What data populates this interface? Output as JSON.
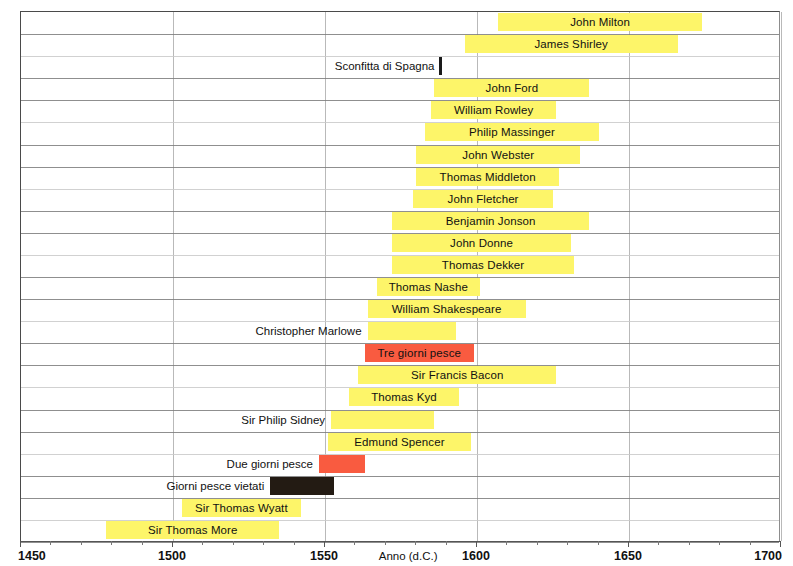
{
  "chart_data": {
    "type": "bar",
    "orientation": "horizontal",
    "title": "",
    "xlabel": "Anno (d.C.)",
    "ylabel": "",
    "xlim": [
      1450,
      1700
    ],
    "xticks": [
      1450,
      1500,
      1550,
      1600,
      1650,
      1700
    ],
    "xticklabels": [
      "1450",
      "1500",
      "1550",
      "1600",
      "1650",
      "1700"
    ],
    "grid": true,
    "legend": "none",
    "colors": {
      "author": "#fdf569",
      "fish_days": "#f95b40",
      "forbidden": "#231b13",
      "event_marker": "#1a1a1a",
      "gridline": "#b9b9b9",
      "axis": "#555555"
    },
    "series": [
      {
        "label": "John Milton",
        "start": 1607,
        "end": 1674,
        "kind": "author",
        "color": "#fdf569"
      },
      {
        "label": "James Shirley",
        "start": 1596,
        "end": 1666,
        "kind": "author",
        "color": "#fdf569"
      },
      {
        "label": "Sconfitta di Spagna",
        "start": 1588,
        "end": 1588,
        "kind": "event",
        "color": "#1a1a1a"
      },
      {
        "label": "John Ford",
        "start": 1586,
        "end": 1637,
        "kind": "author",
        "color": "#fdf569"
      },
      {
        "label": "William Rowley",
        "start": 1585,
        "end": 1626,
        "kind": "author",
        "color": "#fdf569"
      },
      {
        "label": "Philip Massinger",
        "start": 1583,
        "end": 1640,
        "kind": "author",
        "color": "#fdf569"
      },
      {
        "label": "John Webster",
        "start": 1580,
        "end": 1634,
        "kind": "author",
        "color": "#fdf569"
      },
      {
        "label": "Thomas Middleton",
        "start": 1580,
        "end": 1627,
        "kind": "author",
        "color": "#fdf569"
      },
      {
        "label": "John Fletcher",
        "start": 1579,
        "end": 1625,
        "kind": "author",
        "color": "#fdf569"
      },
      {
        "label": "Benjamin Jonson",
        "start": 1572,
        "end": 1637,
        "kind": "author",
        "color": "#fdf569"
      },
      {
        "label": "John Donne",
        "start": 1572,
        "end": 1631,
        "kind": "author",
        "color": "#fdf569"
      },
      {
        "label": "Thomas Dekker",
        "start": 1572,
        "end": 1632,
        "kind": "author",
        "color": "#fdf569"
      },
      {
        "label": "Thomas Nashe",
        "start": 1567,
        "end": 1601,
        "kind": "author",
        "color": "#fdf569"
      },
      {
        "label": "William Shakespeare",
        "start": 1564,
        "end": 1616,
        "kind": "author",
        "color": "#fdf569"
      },
      {
        "label": "Christopher Marlowe",
        "start": 1564,
        "end": 1593,
        "kind": "author",
        "color": "#fdf569"
      },
      {
        "label": "Tre giorni pesce",
        "start": 1563,
        "end": 1599,
        "kind": "fish",
        "color": "#f95b40"
      },
      {
        "label": "Sir Francis Bacon",
        "start": 1561,
        "end": 1626,
        "kind": "author",
        "color": "#fdf569"
      },
      {
        "label": "Thomas Kyd",
        "start": 1558,
        "end": 1594,
        "kind": "author",
        "color": "#fdf569"
      },
      {
        "label": "Sir Philip Sidney",
        "start": 1552,
        "end": 1586,
        "kind": "author",
        "color": "#fdf569"
      },
      {
        "label": "Edmund Spencer",
        "start": 1551,
        "end": 1598,
        "kind": "author",
        "color": "#fdf569"
      },
      {
        "label": "Due giorni pesce",
        "start": 1548,
        "end": 1563,
        "kind": "fish",
        "color": "#f95b40"
      },
      {
        "label": "Giorni pesce vietati",
        "start": 1532,
        "end": 1553,
        "kind": "forbidden",
        "color": "#231b13"
      },
      {
        "label": "Sir Thomas Wyatt",
        "start": 1503,
        "end": 1542,
        "kind": "author",
        "color": "#fdf569"
      },
      {
        "label": "Sir Thomas More",
        "start": 1478,
        "end": 1535,
        "kind": "author",
        "color": "#fdf569"
      }
    ]
  }
}
